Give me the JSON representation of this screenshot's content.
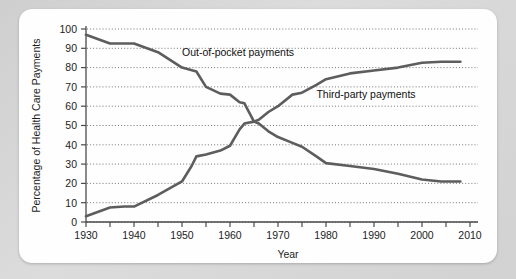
{
  "chart_data": {
    "type": "line",
    "title": "",
    "xlabel": "Year",
    "ylabel": "Percentage of Health Care Payments",
    "xlim": [
      1930,
      2010
    ],
    "ylim": [
      0,
      100
    ],
    "grid": true,
    "legend_position": "inline-annotations",
    "xticks": [
      1930,
      1935,
      1940,
      1945,
      1950,
      1955,
      1960,
      1965,
      1970,
      1975,
      1980,
      1985,
      1990,
      1995,
      2000,
      2005,
      2010
    ],
    "xtick_labels": [
      "1930",
      "",
      "1940",
      "",
      "1950",
      "",
      "1960",
      "",
      "1970",
      "",
      "1980",
      "",
      "1990",
      "",
      "2000",
      "",
      "2010"
    ],
    "yticks": [
      0,
      10,
      20,
      30,
      40,
      50,
      60,
      70,
      80,
      90,
      100
    ],
    "ytick_labels": [
      "0",
      "10",
      "20",
      "30",
      "40",
      "50",
      "60",
      "70",
      "80",
      "90",
      "100"
    ],
    "series": [
      {
        "name": "Out-of-pocket payments",
        "label_x": 1950,
        "label_y": 86,
        "x": [
          1930,
          1935,
          1940,
          1945,
          1950,
          1953,
          1955,
          1958,
          1960,
          1962,
          1963,
          1965,
          1966,
          1968,
          1970,
          1973,
          1975,
          1978,
          1980,
          1985,
          1990,
          1995,
          2000,
          2004,
          2008
        ],
        "values": [
          97,
          92.5,
          92.5,
          88,
          80,
          78,
          70,
          66.5,
          66,
          62,
          61.5,
          52,
          51,
          47,
          44,
          41,
          39,
          34,
          30.5,
          29,
          27.5,
          25,
          22,
          21,
          21
        ]
      },
      {
        "name": "Third-party payments",
        "label_x": 1978,
        "label_y": 64,
        "x": [
          1930,
          1935,
          1938,
          1940,
          1945,
          1950,
          1952,
          1953,
          1955,
          1958,
          1960,
          1962,
          1963,
          1965,
          1966,
          1968,
          1970,
          1973,
          1975,
          1978,
          1980,
          1985,
          1990,
          1995,
          2000,
          2004,
          2008
        ],
        "values": [
          3,
          7.5,
          8,
          8,
          14,
          21,
          29,
          34,
          35,
          37,
          39.5,
          48,
          51,
          52,
          53,
          57,
          60,
          66,
          67,
          71,
          74,
          77,
          78.5,
          80,
          82.5,
          83,
          83
        ]
      }
    ]
  },
  "annotations": {
    "out_of_pocket_label": "Out-of-pocket payments",
    "third_party_label": "Third-party payments"
  }
}
